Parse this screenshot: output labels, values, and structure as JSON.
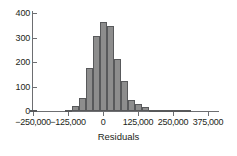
{
  "chart_data": {
    "type": "bar",
    "title": "",
    "subtitle": "",
    "xlabel": "Residuals",
    "ylabel": "",
    "grid": false,
    "legend": false,
    "bin_width": 25000,
    "xlim": [
      -262500,
      400000
    ],
    "ylim": [
      0,
      430
    ],
    "xticks": [
      -250000,
      -125000,
      0,
      125000,
      250000,
      375000
    ],
    "xticklabels": [
      "−250,000",
      "−125,000",
      "0",
      "125,000",
      "250,000",
      "375,000"
    ],
    "yticks": [
      0,
      100,
      200,
      300,
      400
    ],
    "yticklabels": [
      "0",
      "100",
      "200",
      "300",
      "400"
    ],
    "bin_starts": [
      -262500,
      -237500,
      -212500,
      -187500,
      -162500,
      -137500,
      -112500,
      -87500,
      -62500,
      -37500,
      -12500,
      12500,
      37500,
      62500,
      87500,
      112500,
      137500,
      162500,
      187500,
      212500,
      237500,
      262500,
      287500
    ],
    "bin_centers": [
      -250000,
      -225000,
      -200000,
      -175000,
      -150000,
      -125000,
      -100000,
      -75000,
      -50000,
      -25000,
      0,
      25000,
      50000,
      75000,
      100000,
      125000,
      150000,
      175000,
      200000,
      225000,
      250000,
      275000,
      300000
    ],
    "values": [
      4,
      0,
      0,
      0,
      0,
      4,
      20,
      54,
      176,
      306,
      365,
      348,
      212,
      123,
      45,
      27,
      18,
      6,
      4,
      4,
      4,
      3,
      3
    ],
    "bar_fill_color": "#8d8d8d",
    "bar_edge_color": "#58595b",
    "axis_color": "#6d6e71",
    "text_color": "#231f20",
    "background_color": "#ffffff"
  }
}
